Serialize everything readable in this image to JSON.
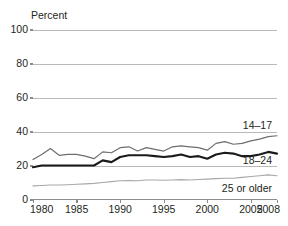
{
  "chart_data": {
    "type": "line",
    "title": "",
    "subtitle": "",
    "xlabel": "",
    "ylabel": "Percent",
    "ylim": [
      0,
      100
    ],
    "xlim": [
      1980,
      2008
    ],
    "yticks": [
      0,
      20,
      40,
      60,
      80,
      100
    ],
    "xticks": [
      1980,
      1985,
      1990,
      1995,
      2000,
      2005,
      2008
    ],
    "ytick_labels": [
      "0",
      "20",
      "40",
      "60",
      "80",
      "100"
    ],
    "xtick_labels": [
      "1980",
      "1985",
      "1990",
      "1995",
      "2000",
      "2005",
      "2008"
    ],
    "grid": "horizontal",
    "legend": "inline-end-of-line-labels",
    "x": [
      1980,
      1981,
      1982,
      1983,
      1984,
      1985,
      1986,
      1987,
      1988,
      1989,
      1990,
      1991,
      1992,
      1993,
      1994,
      1995,
      1996,
      1997,
      1998,
      1999,
      2000,
      2001,
      2002,
      2003,
      2004,
      2005,
      2006,
      2007,
      2008
    ],
    "series": [
      {
        "name": "14-17",
        "label": "14–17",
        "color": "#6e6e6e",
        "values": [
          23.5,
          26.5,
          30.0,
          26.0,
          26.5,
          26.5,
          25.5,
          24.0,
          28.0,
          27.5,
          30.5,
          31.0,
          28.5,
          30.5,
          29.5,
          28.5,
          31.0,
          31.5,
          31.0,
          30.5,
          29.0,
          33.0,
          34.0,
          32.5,
          33.0,
          34.5,
          35.5,
          37.0,
          37.5
        ]
      },
      {
        "name": "18-24",
        "label": "18–24",
        "color": "#1a1a1a",
        "values": [
          19.0,
          20.0,
          20.0,
          20.0,
          20.0,
          20.0,
          20.0,
          20.0,
          23.0,
          22.0,
          25.0,
          26.0,
          26.0,
          26.0,
          25.5,
          25.0,
          25.5,
          26.5,
          25.0,
          25.5,
          24.0,
          26.5,
          27.5,
          27.0,
          25.5,
          25.5,
          26.5,
          28.0,
          27.0
        ]
      },
      {
        "name": "25 or older",
        "label": "25 or older",
        "color": "#a8a8a8",
        "values": [
          8.0,
          8.2,
          8.5,
          8.5,
          8.7,
          9.0,
          9.2,
          9.5,
          10.0,
          10.5,
          11.0,
          11.2,
          11.0,
          11.5,
          11.5,
          11.3,
          11.5,
          11.7,
          11.5,
          11.8,
          12.0,
          12.3,
          12.5,
          12.5,
          13.0,
          13.5,
          14.0,
          14.5,
          14.0
        ]
      }
    ],
    "annotations": [
      {
        "text": "14–17",
        "series": "14-17"
      },
      {
        "text": "18–24",
        "series": "18-24"
      },
      {
        "text": "25 or older",
        "series": "25 or older"
      }
    ]
  }
}
